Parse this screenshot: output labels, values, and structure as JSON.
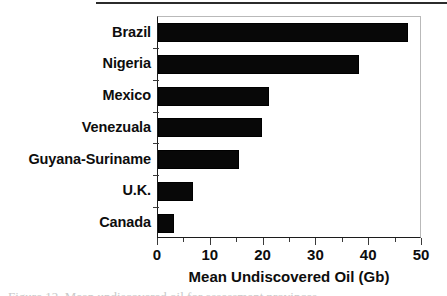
{
  "chart_data": {
    "type": "bar",
    "orientation": "horizontal",
    "title": "",
    "xlabel": "Mean Undiscovered Oil (Gb)",
    "ylabel": "",
    "categories": [
      "Brazil",
      "Nigeria",
      "Mexico",
      "Venezuala",
      "Guyana-Suriname",
      "U.K.",
      "Canada"
    ],
    "values": [
      47.3,
      38.0,
      21.0,
      19.7,
      15.3,
      6.6,
      3.0
    ],
    "xlim": [
      0,
      50
    ],
    "xticks": [
      0,
      10,
      20,
      30,
      40,
      50
    ],
    "xtick_labels": [
      "0",
      "10",
      "20",
      "30",
      "40",
      "50"
    ],
    "minor_xticks": [
      5,
      15,
      25,
      35,
      45
    ],
    "grid": false,
    "legend": null,
    "bar_color": "#080808",
    "frame_color": "#b9b9b9",
    "axis_color": "#1c1c1c"
  },
  "figure": {
    "axis_title": "Mean Undiscovered Oil (Gb)",
    "caption_sliver": "Figure 12.  Mean undiscovered oil for assessment provinces"
  }
}
